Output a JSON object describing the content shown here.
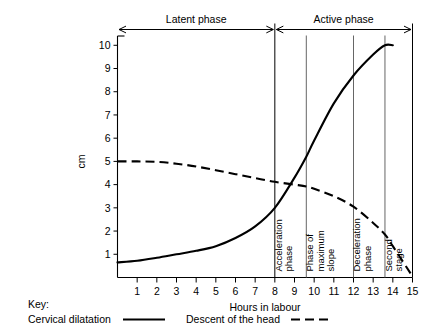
{
  "figure": {
    "title": "",
    "phases": [
      {
        "label": "Latent phase",
        "start_hour": 0,
        "end_hour": 8
      },
      {
        "label": "Active phase",
        "start_hour": 8,
        "end_hour": 15
      }
    ],
    "vertical_labels": [
      {
        "text_lines": [
          "Acceleration",
          "phase"
        ],
        "at_hour": 8.35
      },
      {
        "text_lines": [
          "Phase of",
          "maximum",
          "slope"
        ],
        "at_hour": 9.95
      },
      {
        "text_lines": [
          "Deceleration",
          "phase"
        ],
        "at_hour": 12.35
      },
      {
        "text_lines": [
          "Second",
          "stage"
        ],
        "at_hour": 13.95
      }
    ],
    "dividers_at_hours": [
      8,
      9.6,
      12,
      13.6
    ],
    "key": {
      "label": "Key:",
      "entries": [
        {
          "name": "Cervical dilatation",
          "style": "solid"
        },
        {
          "name": "Descent of the head",
          "style": "dashed"
        }
      ]
    }
  },
  "chart_data": {
    "type": "line",
    "title": "",
    "xlabel": "Hours in labour",
    "ylabel": "cm",
    "xlim": [
      0,
      15
    ],
    "ylim": [
      0,
      10.4
    ],
    "xticks": [
      1,
      2,
      3,
      4,
      5,
      6,
      7,
      8,
      9,
      10,
      11,
      12,
      13,
      14,
      15
    ],
    "yticks": [
      1,
      2,
      3,
      4,
      5,
      6,
      7,
      8,
      9,
      10
    ],
    "grid": false,
    "legend_position": "below-axes",
    "series": [
      {
        "name": "Cervical dilatation",
        "style": "solid",
        "color": "#000000",
        "x": [
          0,
          1,
          2,
          3,
          4,
          5,
          6,
          7,
          8,
          9,
          9.6,
          10,
          11,
          12,
          13,
          13.6,
          14
        ],
        "values": [
          0.65,
          0.72,
          0.85,
          1.0,
          1.15,
          1.35,
          1.7,
          2.2,
          3.0,
          4.3,
          5.2,
          5.9,
          7.5,
          8.7,
          9.6,
          10.0,
          10.0
        ]
      },
      {
        "name": "Descent of the head",
        "style": "dashed",
        "color": "#000000",
        "x": [
          0,
          1,
          2,
          3,
          4,
          5,
          6,
          7,
          8,
          9,
          9.6,
          10,
          11,
          12,
          13,
          13.6,
          14,
          15
        ],
        "values": [
          5.0,
          5.0,
          4.98,
          4.9,
          4.78,
          4.62,
          4.45,
          4.28,
          4.12,
          4.0,
          3.92,
          3.82,
          3.5,
          3.05,
          2.35,
          1.85,
          1.35,
          0.05
        ]
      }
    ]
  }
}
